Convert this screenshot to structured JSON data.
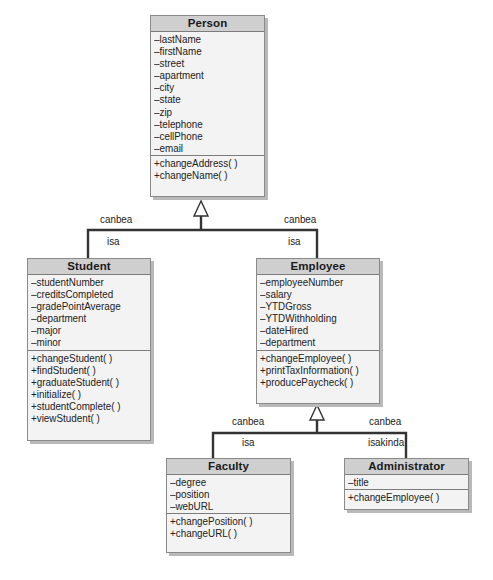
{
  "classes": {
    "person": {
      "name": "Person",
      "attributes": [
        "–lastName",
        "–firstName",
        "–street",
        "–apartment",
        "–city",
        "–state",
        "–zip",
        "–telephone",
        "–cellPhone",
        "–email"
      ],
      "methods": [
        "+changeAddress( )",
        "+changeName( )"
      ]
    },
    "student": {
      "name": "Student",
      "attributes": [
        "–studentNumber",
        "–creditsCompleted",
        "–gradePointAverage",
        "–department",
        "–major",
        "–minor"
      ],
      "methods": [
        "+changeStudent( )",
        "+findStudent( )",
        "+graduateStudent( )",
        "+initialize( )",
        "+studentComplete( )",
        "+viewStudent( )"
      ]
    },
    "employee": {
      "name": "Employee",
      "attributes": [
        "–employeeNumber",
        "–salary",
        "–YTDGross",
        "–YTDWithholding",
        "–dateHired",
        "–department"
      ],
      "methods": [
        "+changeEmployee( )",
        "+printTaxInformation( )",
        "+producePaycheck( )"
      ]
    },
    "faculty": {
      "name": "Faculty",
      "attributes": [
        "–degree",
        "–position",
        "–webURL"
      ],
      "methods": [
        "+changePosition( )",
        "+changeURL( )"
      ]
    },
    "administrator": {
      "name": "Administrator",
      "attributes": [
        "–title"
      ],
      "methods": [
        "+changeEmployee( )"
      ]
    }
  },
  "relationships": {
    "student_person": {
      "top": "canbea",
      "bottom": "isa"
    },
    "employee_person": {
      "top": "canbea",
      "bottom": "isa"
    },
    "faculty_employee": {
      "top": "canbea",
      "bottom": "isa"
    },
    "administrator_employee": {
      "top": "canbea",
      "bottom": "isakinda"
    }
  },
  "colors": {
    "title_bar": "#cfcfcf",
    "box_body": "#f3f3f3",
    "border": "#8a8a8a",
    "line": "#333333"
  }
}
